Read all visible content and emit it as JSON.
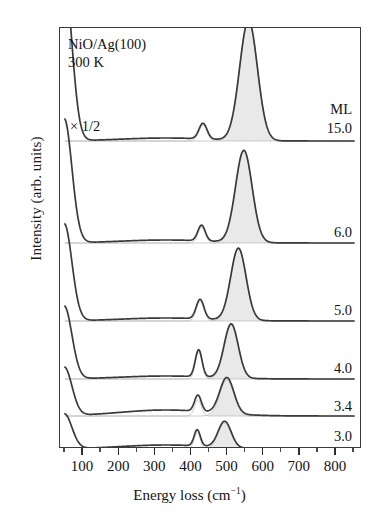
{
  "figure": {
    "sample_label": "NiO/Ag(100)",
    "temperature_label": "300 K",
    "scale_label": "× 1/2",
    "ml_header": "ML",
    "y_axis_label": "Intensity (arb. units)",
    "x_axis_label_prefix": "Energy loss (cm",
    "x_axis_label_suffix": ")",
    "x_axis_exponent": "−1"
  },
  "chart_data": {
    "type": "line",
    "title": "NiO/Ag(100) 300 K",
    "subtitle": "HREELS spectra vs. NiO coverage",
    "xlabel": "Energy loss (cm−1)",
    "ylabel": "Intensity (arb. units)",
    "xlim": [
      50,
      850
    ],
    "ylim": [
      0,
      6
    ],
    "grid": false,
    "legend_position": "right-inline",
    "xticks": [
      100,
      200,
      300,
      400,
      500,
      600,
      700,
      800
    ],
    "xticklabels": [
      "100",
      "200",
      "300",
      "400",
      "500",
      "600",
      "700",
      "800"
    ],
    "minor_tick_step": 50,
    "annotations": [
      {
        "text": "NiO/Ag(100)",
        "x": 110,
        "y": 5.85
      },
      {
        "text": "300 K",
        "x": 110,
        "y": 5.6
      },
      {
        "text": "× 1/2",
        "x": 120,
        "y": 4.75
      },
      {
        "text": "ML",
        "x": 800,
        "y": 4.55
      }
    ],
    "trace_label_header": "ML",
    "series": [
      {
        "name": "15.0",
        "label": "15.0",
        "coverage_ML": 15.0,
        "scaled": true,
        "scale_factor": 0.5,
        "baseline_y": 140,
        "peaks": [
          {
            "center_cm1": 432,
            "height_rel": 0.13,
            "width_cm1": 26,
            "filled": false
          },
          {
            "center_cm1": 558,
            "height_rel": 1.0,
            "width_cm1": 58,
            "filled": true
          }
        ]
      },
      {
        "name": "6.0",
        "label": "6.0",
        "coverage_ML": 6.0,
        "scaled": false,
        "baseline_y": 242,
        "peaks": [
          {
            "center_cm1": 428,
            "height_rel": 0.17,
            "width_cm1": 24,
            "filled": false
          },
          {
            "center_cm1": 545,
            "height_rel": 1.0,
            "width_cm1": 54,
            "filled": true
          }
        ]
      },
      {
        "name": "5.0",
        "label": "5.0",
        "coverage_ML": 5.0,
        "scaled": false,
        "baseline_y": 320,
        "peaks": [
          {
            "center_cm1": 424,
            "height_rel": 0.27,
            "width_cm1": 25,
            "filled": false
          },
          {
            "center_cm1": 530,
            "height_rel": 1.0,
            "width_cm1": 50,
            "filled": true
          }
        ]
      },
      {
        "name": "4.0",
        "label": "4.0",
        "coverage_ML": 4.0,
        "scaled": false,
        "baseline_y": 378,
        "peaks": [
          {
            "center_cm1": 420,
            "height_rel": 0.5,
            "width_cm1": 22,
            "filled": false
          },
          {
            "center_cm1": 510,
            "height_rel": 1.0,
            "width_cm1": 46,
            "filled": true
          }
        ]
      },
      {
        "name": "3.4",
        "label": "3.4",
        "coverage_ML": 3.4,
        "scaled": false,
        "baseline_y": 415,
        "peaks": [
          {
            "center_cm1": 418,
            "height_rel": 0.45,
            "width_cm1": 22,
            "filled": false
          },
          {
            "center_cm1": 498,
            "height_rel": 1.0,
            "width_cm1": 46,
            "filled": true
          }
        ]
      },
      {
        "name": "3.0",
        "label": "3.0",
        "coverage_ML": 3.0,
        "scaled": false,
        "baseline_y": 448,
        "peaks": [
          {
            "center_cm1": 416,
            "height_rel": 0.62,
            "width_cm1": 20,
            "filled": false
          },
          {
            "center_cm1": 492,
            "height_rel": 1.0,
            "width_cm1": 42,
            "filled": true
          }
        ]
      }
    ],
    "colors": {
      "line": "#3a3a3a",
      "fill": "#e9e9e9",
      "component": "#b4b4b4",
      "frame": "#3a3a3a",
      "text": "#131313"
    }
  }
}
